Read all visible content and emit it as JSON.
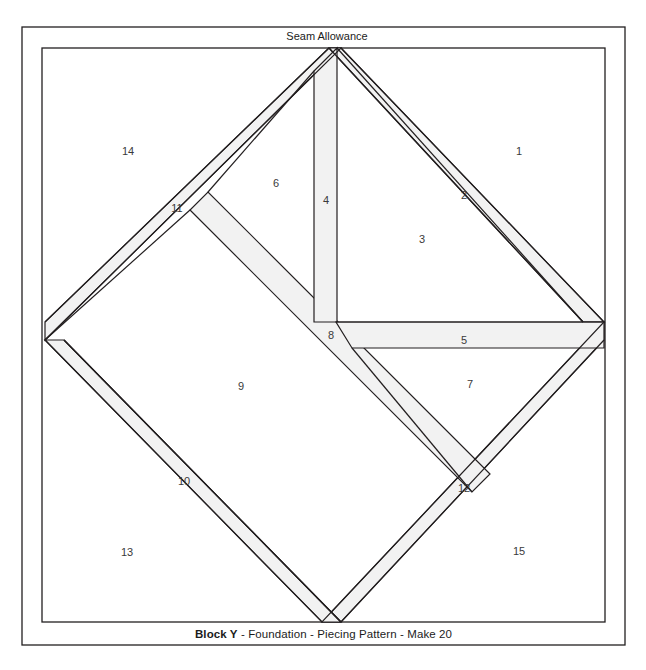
{
  "document": {
    "title": "Block Y - Foundation - Piecing Pattern - Make 20",
    "seam_allowance_label": "Seam Allowance",
    "caption": {
      "block_name": "Block Y",
      "rest": " - Foundation - Piecing Pattern - Make 20"
    }
  },
  "colors": {
    "line": "#231f20",
    "strip_fill": "#f2f2f2",
    "background": "#ffffff",
    "number_text": "#3a3a3a",
    "caption_text": "#1c1c1c"
  },
  "frame": {
    "outer": {
      "x": 22,
      "y": 27,
      "width": 603,
      "height": 618
    },
    "inner": {
      "x": 42,
      "y": 48,
      "width": 563,
      "height": 574
    }
  },
  "diamond": {
    "top": {
      "x": 341,
      "y": 48
    },
    "right": {
      "x": 604,
      "y": 322
    },
    "bottom": {
      "x": 322,
      "y": 622
    },
    "left": {
      "x": 45,
      "y": 340
    }
  },
  "pieces": [
    {
      "id": "1",
      "label": "1",
      "x": 519,
      "y": 152
    },
    {
      "id": "2",
      "label": "2",
      "x": 464,
      "y": 196
    },
    {
      "id": "3",
      "label": "3",
      "x": 422,
      "y": 240
    },
    {
      "id": "4",
      "label": "4",
      "x": 326,
      "y": 201
    },
    {
      "id": "5",
      "label": "5",
      "x": 464,
      "y": 341
    },
    {
      "id": "6",
      "label": "6",
      "x": 276,
      "y": 184
    },
    {
      "id": "7",
      "label": "7",
      "x": 470,
      "y": 385
    },
    {
      "id": "8",
      "label": "8",
      "x": 331,
      "y": 336
    },
    {
      "id": "9",
      "label": "9",
      "x": 241,
      "y": 387
    },
    {
      "id": "10",
      "label": "10",
      "x": 184,
      "y": 482
    },
    {
      "id": "11",
      "label": "11",
      "x": 177,
      "y": 209
    },
    {
      "id": "12",
      "label": "12",
      "x": 464,
      "y": 489
    },
    {
      "id": "13",
      "label": "13",
      "x": 127,
      "y": 553
    },
    {
      "id": "14",
      "label": "14",
      "x": 128,
      "y": 152
    },
    {
      "id": "15",
      "label": "15",
      "x": 519,
      "y": 552
    }
  ]
}
